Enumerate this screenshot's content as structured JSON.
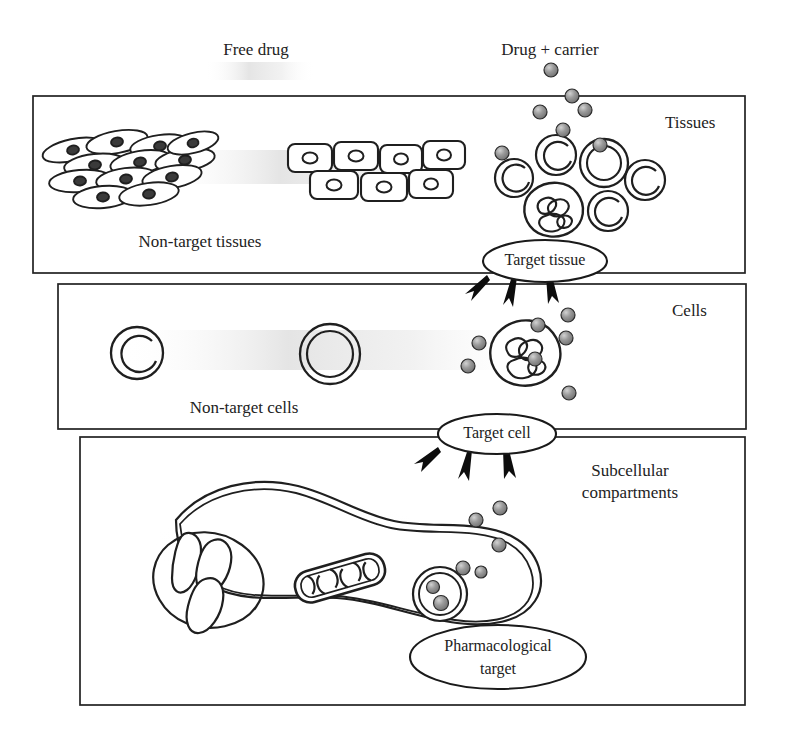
{
  "figure": {
    "type": "diagram",
    "background_color": "#ffffff",
    "line_color": "#1a1a1a",
    "particle_color": "#8c8c8c",
    "particle_edge_color": "#2b2b2b"
  },
  "top_labels": {
    "free_drug": "Free drug",
    "drug_carrier": "Drug  +  carrier"
  },
  "panels": [
    {
      "id": "tissues",
      "label": "Tissues",
      "inner_label": "Non-target tissues",
      "order": 1
    },
    {
      "id": "cells",
      "label": "Cells",
      "inner_label": "Non-target cells",
      "order": 2
    },
    {
      "id": "subcellular",
      "label_line1": "Subcellular",
      "label_line2": "compartments",
      "order": 3
    }
  ],
  "bubbles": [
    {
      "id": "target-tissue",
      "text": "Target tissue"
    },
    {
      "id": "target-cell",
      "text": "Target cell"
    },
    {
      "id": "pharmacological-target",
      "line1": "Pharmacological",
      "line2": "target"
    }
  ],
  "structures": {
    "non_target_tissue_fibroblasts": 12,
    "non_target_tissue_epithelial": 7,
    "target_tissue_cells": 6,
    "non_target_cells": 2,
    "target_cell_nucleus": "lobed",
    "subcellular_organelles": [
      "nucleus-lobed",
      "mitochondrion",
      "endosome"
    ],
    "arrow_groups": [
      {
        "from": "target-tissue",
        "count": 3
      },
      {
        "from": "target-cell",
        "count": 3
      }
    ]
  }
}
